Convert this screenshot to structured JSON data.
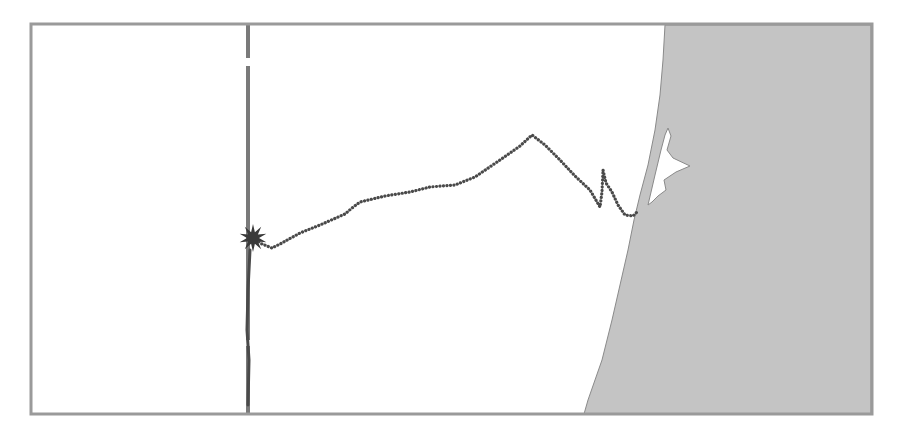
{
  "map": {
    "frame": {
      "x": 31,
      "y": 24,
      "width": 841,
      "height": 390,
      "stroke": "#9a9a9a"
    },
    "colors": {
      "land": "#c4c4c4",
      "sea": "#ffffff",
      "lagoon": "#ffffff",
      "coastline": "#8a8a8a",
      "track": "#4a4a4a",
      "meridian": "#7a7a7a",
      "marker": "#3a3a3a"
    },
    "land_polygon": "665,25 871,25 871,414 584,414 588,400 602,360 612,320 620,285 628,250 634,220 640,195 648,165 655,130 660,95 663,60 665,25",
    "lagoon_polygon": "648,205 655,175 661,150 665,135 668,128 671,136 667,150 673,158 690,166 676,172 664,180 666,190 658,196 652,202",
    "meridian_line": {
      "x": 248,
      "y1": 24,
      "y2": 414,
      "gaps": [
        [
          58,
          66
        ],
        [
          340,
          346
        ]
      ]
    },
    "marker": {
      "name": "release-point",
      "icon": "star-burst-icon",
      "x": 253,
      "y": 238
    },
    "track": {
      "name": "drift-track",
      "points": [
        [
          253,
          238
        ],
        [
          262,
          244
        ],
        [
          272,
          248
        ],
        [
          280,
          244
        ],
        [
          300,
          233
        ],
        [
          320,
          225
        ],
        [
          345,
          214
        ],
        [
          352,
          208
        ],
        [
          360,
          202
        ],
        [
          385,
          196
        ],
        [
          410,
          192
        ],
        [
          430,
          187
        ],
        [
          455,
          185
        ],
        [
          475,
          177
        ],
        [
          500,
          160
        ],
        [
          520,
          146
        ],
        [
          532,
          135
        ],
        [
          545,
          145
        ],
        [
          560,
          160
        ],
        [
          575,
          176
        ],
        [
          590,
          190
        ],
        [
          600,
          207
        ],
        [
          602,
          192
        ],
        [
          603,
          170
        ],
        [
          606,
          183
        ],
        [
          612,
          192
        ],
        [
          618,
          205
        ],
        [
          625,
          215
        ],
        [
          633,
          216
        ],
        [
          638,
          211
        ]
      ],
      "south_points": [
        [
          250,
          250
        ],
        [
          248,
          290
        ],
        [
          247,
          330
        ],
        [
          249,
          360
        ],
        [
          248,
          405
        ]
      ]
    }
  }
}
